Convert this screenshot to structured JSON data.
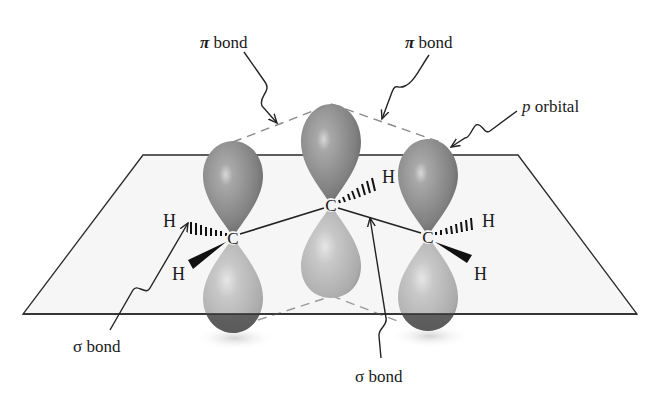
{
  "diagram": {
    "type": "molecular-orbital-diagram",
    "colors": {
      "background": "#ffffff",
      "plane_fill": "#f6f6f6",
      "line": "#2a2a2a",
      "upper_lobe": "#8e8e8e",
      "lower_lobe": "#c4c4c4",
      "dashed": "#8a8a8a"
    },
    "labels": {
      "pi_bond_left": {
        "symbol": "π",
        "text": " bond"
      },
      "pi_bond_right": {
        "symbol": "π",
        "text": " bond"
      },
      "p_orbital": {
        "symbol": "p",
        "text": " orbital"
      },
      "sigma_bond_left": {
        "symbol": "σ",
        "text": " bond"
      },
      "sigma_bond_bottom": {
        "symbol": "σ",
        "text": " bond"
      }
    },
    "atoms": {
      "carbons": [
        {
          "id": "C1",
          "label": "C"
        },
        {
          "id": "C2",
          "label": "C"
        },
        {
          "id": "C3",
          "label": "C"
        }
      ],
      "hydrogens": [
        {
          "id": "H1a",
          "label": "H",
          "bond": "hashed"
        },
        {
          "id": "H1b",
          "label": "H",
          "bond": "wedge"
        },
        {
          "id": "H2",
          "label": "H",
          "bond": "hashed"
        },
        {
          "id": "H3a",
          "label": "H",
          "bond": "hashed"
        },
        {
          "id": "H3b",
          "label": "H",
          "bond": "wedge"
        }
      ]
    }
  }
}
